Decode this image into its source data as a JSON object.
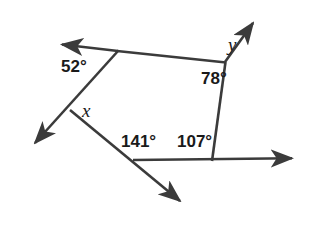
{
  "figure": {
    "type": "geometry-diagram",
    "background_color": "#ffffff",
    "stroke_color": "#3b3b3b",
    "text_color": "#1a1a1a",
    "width": 320,
    "height": 226
  },
  "labels": {
    "angle_52": "52°",
    "angle_78": "78°",
    "angle_141": "141°",
    "angle_107": "107°",
    "unknown_x": "x",
    "unknown_y": "y"
  },
  "geometry": {
    "vertices": {
      "top_left": [
        118,
        51
      ],
      "left_middle": [
        70,
        110
      ],
      "top_right": [
        225,
        62
      ],
      "bottom_right": [
        212,
        160
      ],
      "bottom_middle": [
        133,
        160
      ]
    },
    "arrow_tips": {
      "upper_left": [
        57,
        44
      ],
      "lower_left": [
        30,
        148
      ],
      "upper_right": [
        256,
        18
      ],
      "right": [
        298,
        158
      ],
      "lower_right": [
        186,
        206
      ]
    },
    "segments": [
      {
        "name": "ray-upper-left",
        "from": [
          118,
          51
        ],
        "to": [
          57,
          44
        ],
        "arrow_at_end": true
      },
      {
        "name": "segment-top",
        "from": [
          118,
          51
        ],
        "to": [
          225,
          62
        ],
        "arrow_at_end": false
      },
      {
        "name": "ray-lower-left",
        "from": [
          118,
          51
        ],
        "to": [
          30,
          148
        ],
        "arrow_at_end": true
      },
      {
        "name": "ray-lower-right",
        "from": [
          70,
          110
        ],
        "to": [
          186,
          206
        ],
        "arrow_at_end": true
      },
      {
        "name": "segment-right",
        "from": [
          225,
          62
        ],
        "to": [
          212,
          160
        ],
        "arrow_at_end": false
      },
      {
        "name": "ray-upper-right",
        "from": [
          225,
          62
        ],
        "to": [
          256,
          18
        ],
        "arrow_at_end": true
      },
      {
        "name": "ray-right-horizontal",
        "from": [
          133,
          160
        ],
        "to": [
          298,
          158
        ],
        "arrow_at_end": true
      }
    ]
  }
}
